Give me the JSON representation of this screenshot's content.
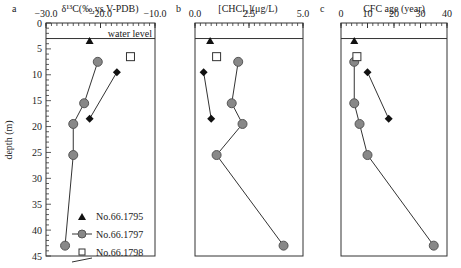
{
  "chart_data": [
    {
      "type": "line",
      "panel": "a",
      "title": "δ13C(‰,vs.V-PDB)",
      "xlabel": "δ13C(‰,vs.V-PDB)",
      "ylabel": "depth (m)",
      "xlim": [
        -30.0,
        -10.0
      ],
      "ylim": [
        0,
        45
      ],
      "x_ticks": [
        "-30.0",
        "-20.0",
        "-10.0"
      ],
      "y_ticks": [
        "0",
        "5",
        "10",
        "15",
        "20",
        "25",
        "30",
        "35",
        "40",
        "45"
      ],
      "annotation": "water level",
      "water_level_depth": 3,
      "series": [
        {
          "name": "No.66.1795",
          "marker": "triangle",
          "line": false,
          "points": [
            [
              -22.0,
              3.5
            ]
          ]
        },
        {
          "name": "No.66.1797",
          "marker": "circle",
          "line": true,
          "points": [
            [
              -20.5,
              7.5
            ],
            [
              -23.0,
              15.5
            ],
            [
              -25.0,
              19.5
            ],
            [
              -25.0,
              25.5
            ],
            [
              -26.5,
              43.0
            ]
          ]
        },
        {
          "name": "No.66.1798",
          "marker": "square",
          "line": false,
          "points": [
            [
              -14.5,
              6.5
            ]
          ]
        },
        {
          "name": "No.66.1799",
          "marker": "diamond",
          "line": true,
          "points": [
            [
              -17.0,
              9.5
            ],
            [
              -22.0,
              18.5
            ]
          ]
        }
      ]
    },
    {
      "type": "line",
      "panel": "b",
      "title": "[CHCl3](μg/L)",
      "xlabel": "[CHCl3](μg/L)",
      "xlim": [
        0.0,
        5.0
      ],
      "ylim": [
        0,
        45
      ],
      "x_ticks": [
        "0.0",
        "2.5",
        "5.0"
      ],
      "water_level_depth": 3,
      "series": [
        {
          "name": "No.66.1795",
          "marker": "triangle",
          "line": false,
          "points": [
            [
              0.7,
              3.5
            ]
          ]
        },
        {
          "name": "No.66.1797",
          "marker": "circle",
          "line": true,
          "points": [
            [
              2.0,
              7.5
            ],
            [
              1.7,
              15.5
            ],
            [
              2.2,
              19.5
            ],
            [
              1.0,
              25.5
            ],
            [
              4.1,
              43.0
            ]
          ]
        },
        {
          "name": "No.66.1798",
          "marker": "square",
          "line": false,
          "points": [
            [
              1.0,
              6.5
            ]
          ]
        },
        {
          "name": "No.66.1799",
          "marker": "diamond",
          "line": true,
          "points": [
            [
              0.4,
              9.5
            ],
            [
              0.75,
              18.5
            ]
          ]
        }
      ]
    },
    {
      "type": "line",
      "panel": "c",
      "title": "CFC age (year)",
      "xlabel": "CFC age (year)",
      "xlim": [
        0,
        40
      ],
      "ylim": [
        0,
        45
      ],
      "x_ticks": [
        "0",
        "10",
        "20",
        "30",
        "40"
      ],
      "water_level_depth": 3,
      "series": [
        {
          "name": "No.66.1795",
          "marker": "triangle",
          "line": false,
          "points": [
            [
              5,
              3.5
            ]
          ]
        },
        {
          "name": "No.66.1797",
          "marker": "circle",
          "line": true,
          "points": [
            [
              5,
              7.5
            ],
            [
              5,
              15.5
            ],
            [
              7,
              19.5
            ],
            [
              10,
              25.5
            ],
            [
              35,
              43.0
            ]
          ]
        },
        {
          "name": "No.66.1798",
          "marker": "square",
          "line": false,
          "points": [
            [
              6,
              6.5
            ]
          ]
        },
        {
          "name": "No.66.1799",
          "marker": "diamond",
          "line": true,
          "points": [
            [
              10,
              9.5
            ],
            [
              18,
              18.5
            ]
          ]
        }
      ]
    }
  ],
  "labels": {
    "panel_a": "a",
    "panel_b": "b",
    "panel_c": "c",
    "title_a": "δ¹³C(‰,vs.V-PDB)",
    "title_b": "[CHCl₃](μg/L)",
    "title_c": "CFC age (year)",
    "ylabel": "depth (m)",
    "water_level": "water level"
  },
  "legend": [
    "No.66.1795",
    "No.66.1797",
    "No.66.1798",
    "No.66.1799"
  ],
  "colors": {
    "circle_fill": "#888888",
    "circle_stroke": "#555555",
    "line": "#333333",
    "marker_black": "#111111"
  }
}
